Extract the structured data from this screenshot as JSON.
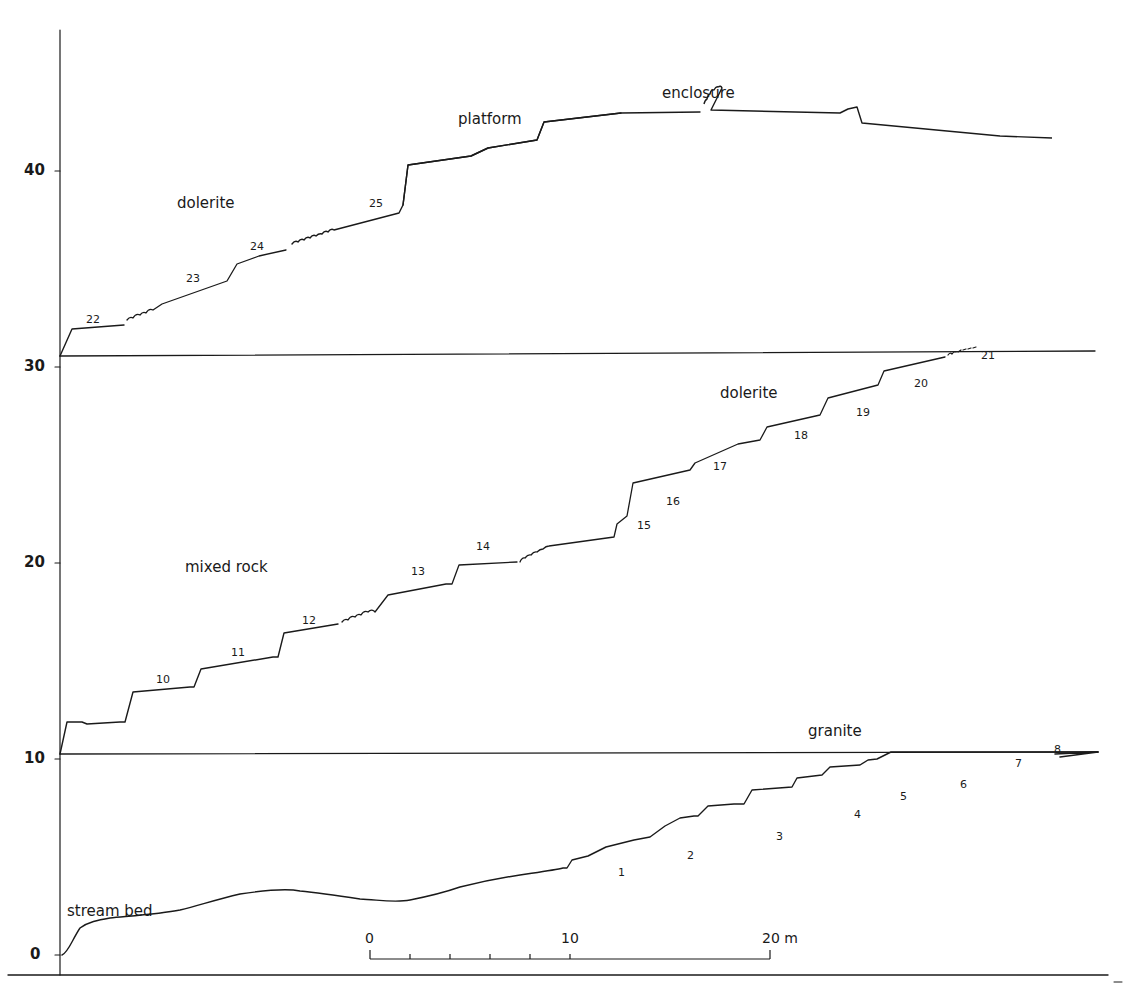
{
  "figure": {
    "type": "stepped terrain profile (three stacked sections)",
    "y_axis": {
      "ticks": [
        {
          "value": 0,
          "label": "0"
        },
        {
          "value": 10,
          "label": "10"
        },
        {
          "value": 20,
          "label": "20"
        },
        {
          "value": 30,
          "label": "30"
        },
        {
          "value": 40,
          "label": "40"
        }
      ]
    },
    "scale_bar": {
      "labels": {
        "start": "0",
        "mid": "10",
        "end": "20 m"
      },
      "minor_divisions": 5
    },
    "regions": [
      {
        "label": "stream bed"
      },
      {
        "label": "granite"
      },
      {
        "label": "mixed rock"
      },
      {
        "label": "dolerite",
        "section": "middle"
      },
      {
        "label": "dolerite",
        "section": "top"
      },
      {
        "label": "platform"
      },
      {
        "label": "enclosure"
      }
    ],
    "terrace_numbers": {
      "bottom": [
        "1",
        "2",
        "3",
        "4",
        "5",
        "6",
        "7",
        "8"
      ],
      "middle": [
        "10",
        "11",
        "12",
        "13",
        "14",
        "15",
        "16",
        "17",
        "18",
        "19",
        "20",
        "21"
      ],
      "top": [
        "22",
        "23",
        "24",
        "25"
      ]
    }
  }
}
